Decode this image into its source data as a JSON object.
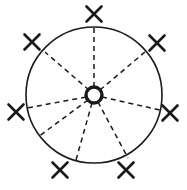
{
  "canvas": {
    "width": 187,
    "height": 190,
    "background": "#ffffff",
    "title": "Wheel hub with radial spokes and cross markers"
  },
  "style": {
    "stroke_color": "#1a1a1a",
    "rim_stroke_width": 1.6,
    "spoke_stroke_width": 1.5,
    "spoke_dash": "5,4",
    "hub_stroke_width": 3.4,
    "cross_stroke_width": 2.6,
    "cross_arm": 7.5
  },
  "rim": {
    "label": "outer-rim-circle",
    "cx": 94,
    "cy": 95,
    "r": 68,
    "fill": "none"
  },
  "hub": {
    "label": "center-hub-circle",
    "cx": 94,
    "cy": 95,
    "r": 8,
    "fill": "none"
  },
  "spokes": [
    {
      "name": "spoke-north",
      "angle_deg": -90,
      "x1": 94,
      "y1": 87,
      "x2": 94,
      "y2": 24
    },
    {
      "name": "spoke-northeast",
      "angle_deg": -43,
      "x1": 100,
      "y1": 90,
      "x2": 145,
      "y2": 52
    },
    {
      "name": "spoke-east",
      "angle_deg": 13,
      "x1": 102,
      "y1": 97,
      "x2": 160,
      "y2": 110
    },
    {
      "name": "spoke-southeast",
      "angle_deg": 58,
      "x1": 98,
      "y1": 102,
      "x2": 128,
      "y2": 158
    },
    {
      "name": "spoke-south",
      "angle_deg": 104,
      "x1": 92,
      "y1": 103,
      "x2": 76,
      "y2": 160
    },
    {
      "name": "spoke-southwest",
      "angle_deg": 143,
      "x1": 88,
      "y1": 100,
      "x2": 38,
      "y2": 137
    },
    {
      "name": "spoke-west",
      "angle_deg": 170,
      "x1": 86,
      "y1": 97,
      "x2": 27,
      "y2": 108
    },
    {
      "name": "spoke-northwest",
      "angle_deg": -137,
      "x1": 89,
      "y1": 90,
      "x2": 45,
      "y2": 52
    }
  ],
  "crosses": [
    {
      "name": "cross-marker-top",
      "position": "top",
      "cx": 94,
      "cy": 14
    },
    {
      "name": "cross-marker-upper-right",
      "position": "upper-right",
      "cx": 157,
      "cy": 43
    },
    {
      "name": "cross-marker-right",
      "position": "right",
      "cx": 170,
      "cy": 113
    },
    {
      "name": "cross-marker-lower-right",
      "position": "lower-right",
      "cx": 126,
      "cy": 170
    },
    {
      "name": "cross-marker-lower-left",
      "position": "lower-left",
      "cx": 60,
      "cy": 170
    },
    {
      "name": "cross-marker-left",
      "position": "left",
      "cx": 16,
      "cy": 112
    },
    {
      "name": "cross-marker-upper-left",
      "position": "upper-left",
      "cx": 32,
      "cy": 42
    }
  ],
  "chart_data": {
    "type": "diagram",
    "counts": {
      "circles": 2,
      "spokes": 8,
      "cross_markers": 7
    }
  }
}
